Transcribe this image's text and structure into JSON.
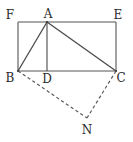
{
  "figure": {
    "kind": "geometry-diagram",
    "width": 133,
    "height": 142,
    "background_color": "#ffffff",
    "stroke_color": "#555555",
    "label_color": "#2b2b2b",
    "points": {
      "F": {
        "label": "F",
        "x": 18,
        "y": 22
      },
      "A": {
        "label": "A",
        "x": 47,
        "y": 22
      },
      "E": {
        "label": "E",
        "x": 116,
        "y": 22
      },
      "B": {
        "label": "B",
        "x": 18,
        "y": 71
      },
      "D": {
        "label": "D",
        "x": 47,
        "y": 71
      },
      "C": {
        "label": "C",
        "x": 116,
        "y": 71
      },
      "N": {
        "label": "N",
        "x": 87,
        "y": 118
      }
    },
    "solid_segments": [
      {
        "name": "side-FE",
        "from": "F",
        "to": "E"
      },
      {
        "name": "side-EC",
        "from": "E",
        "to": "C"
      },
      {
        "name": "side-CB",
        "from": "C",
        "to": "B"
      },
      {
        "name": "side-BF",
        "from": "B",
        "to": "F"
      },
      {
        "name": "segment-AB",
        "from": "A",
        "to": "B"
      },
      {
        "name": "segment-AC",
        "from": "A",
        "to": "C"
      },
      {
        "name": "segment-AD",
        "from": "A",
        "to": "D"
      }
    ],
    "dashed_segments": [
      {
        "name": "segment-BN",
        "from": "B",
        "to": "N"
      },
      {
        "name": "segment-CN",
        "from": "C",
        "to": "N"
      }
    ]
  }
}
